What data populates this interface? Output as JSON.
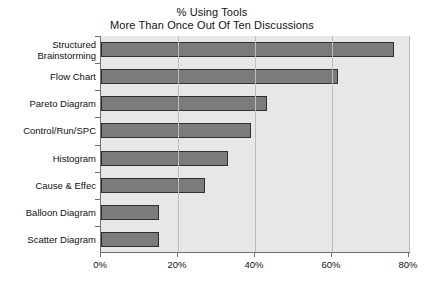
{
  "chart_data": {
    "type": "bar",
    "orientation": "horizontal",
    "title": "% Using Tools",
    "subtitle": "More Than Once Out Of Ten Discussions",
    "title_lines": [
      "% Using Tools",
      "More Than Once Out Of Ten Discussions"
    ],
    "xlabel": "",
    "ylabel": "",
    "categories": [
      "Structured Brainstorming",
      "Flow Chart",
      "Pareto Diagram",
      "Control/Run/SPC",
      "Histogram",
      "Cause & Effec",
      "Balloon Diagram",
      "Scatter Diagram"
    ],
    "category_lines": [
      [
        "Structured",
        "Brainstorming"
      ],
      [
        "Flow Chart"
      ],
      [
        "Pareto Diagram"
      ],
      [
        "Control/Run/SPC"
      ],
      [
        "Histogram"
      ],
      [
        "Cause & Effec"
      ],
      [
        "Balloon Diagram"
      ],
      [
        "Scatter Diagram"
      ]
    ],
    "values": [
      76,
      61.5,
      43,
      39,
      33,
      27,
      15,
      15
    ],
    "xlim": [
      0,
      80
    ],
    "xticks": [
      0,
      20,
      40,
      60,
      80
    ],
    "xtick_labels": [
      "0%",
      "20%",
      "40%",
      "60%",
      "80%"
    ],
    "grid": "vertical",
    "legend": "none",
    "colors": {
      "bar_fill": "#7b7b7b",
      "bar_edge": "#2f2f2f",
      "plot_background": "#e7e7e7",
      "page_background": "#ffffff",
      "gridline": "#bdbdbd",
      "axis": "#6f6f6f",
      "text": "#111111"
    }
  }
}
